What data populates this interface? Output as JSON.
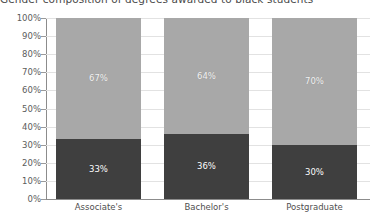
{
  "chart_data": {
    "type": "bar",
    "subtype": "100% stacked column",
    "title": "Gender composition of degrees awarded to black students",
    "title_clipped": true,
    "xlabel": "",
    "ylabel": "",
    "categories": [
      "Associate's",
      "Bachelor's",
      "Postgraduate"
    ],
    "series": [
      {
        "name": "upper",
        "color": "#a8a8a8",
        "values": [
          67,
          64,
          70
        ],
        "labels": [
          "67%",
          "64%",
          "70%"
        ]
      },
      {
        "name": "lower",
        "color": "#3f3f3f",
        "values": [
          33,
          36,
          30
        ],
        "labels": [
          "33%",
          "36%",
          "30%"
        ]
      }
    ],
    "ylim": [
      0,
      100
    ],
    "ytick_values": [
      0,
      10,
      20,
      30,
      40,
      50,
      60,
      70,
      80,
      90,
      100
    ],
    "ytick_labels": [
      "0%",
      "10%",
      "20%",
      "30%",
      "40%",
      "50%",
      "60%",
      "70%",
      "80%",
      "90%",
      "100%"
    ],
    "grid": true,
    "grid_color": "#e2e2e2",
    "legend": false,
    "legend_position": "none",
    "axis_color": "#8c8c8c",
    "background": "#ffffff",
    "stack_total": 100
  }
}
